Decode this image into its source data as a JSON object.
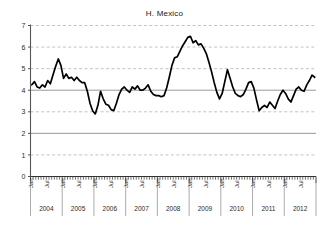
{
  "chart_data": {
    "type": "line",
    "title": "H. Mexico",
    "xlabel": "",
    "ylabel": "",
    "ylim": [
      0,
      7
    ],
    "yticks": [
      0,
      1,
      2,
      3,
      4,
      5,
      6,
      7
    ],
    "ytick_labels": [
      "0",
      "1",
      "2",
      "3",
      "4",
      "5",
      "6",
      "7"
    ],
    "solid_gridlines": [
      2,
      4
    ],
    "dashed_gridlines": [
      1,
      3,
      5,
      6,
      7
    ],
    "grid": true,
    "legend": null,
    "legend_position": "none",
    "line_color": "#000000",
    "x_start_label": "Jan 2004",
    "x_end_label": "Dec 2012",
    "month_tick_labels": [
      "Jan",
      "Jul"
    ],
    "years": [
      "2004",
      "2005",
      "2006",
      "2007",
      "2008",
      "2009",
      "2010",
      "2011",
      "2012"
    ],
    "x": [
      "2004-01",
      "2004-02",
      "2004-03",
      "2004-04",
      "2004-05",
      "2004-06",
      "2004-07",
      "2004-08",
      "2004-09",
      "2004-10",
      "2004-11",
      "2004-12",
      "2005-01",
      "2005-02",
      "2005-03",
      "2005-04",
      "2005-05",
      "2005-06",
      "2005-07",
      "2005-08",
      "2005-09",
      "2005-10",
      "2005-11",
      "2005-12",
      "2006-01",
      "2006-02",
      "2006-03",
      "2006-04",
      "2006-05",
      "2006-06",
      "2006-07",
      "2006-08",
      "2006-09",
      "2006-10",
      "2006-11",
      "2006-12",
      "2007-01",
      "2007-02",
      "2007-03",
      "2007-04",
      "2007-05",
      "2007-06",
      "2007-07",
      "2007-08",
      "2007-09",
      "2007-10",
      "2007-11",
      "2007-12",
      "2008-01",
      "2008-02",
      "2008-03",
      "2008-04",
      "2008-05",
      "2008-06",
      "2008-07",
      "2008-08",
      "2008-09",
      "2008-10",
      "2008-11",
      "2008-12",
      "2009-01",
      "2009-02",
      "2009-03",
      "2009-04",
      "2009-05",
      "2009-06",
      "2009-07",
      "2009-08",
      "2009-09",
      "2009-10",
      "2009-11",
      "2009-12",
      "2010-01",
      "2010-02",
      "2010-03",
      "2010-04",
      "2010-05",
      "2010-06",
      "2010-07",
      "2010-08",
      "2010-09",
      "2010-10",
      "2010-11",
      "2010-12",
      "2011-01",
      "2011-02",
      "2011-03",
      "2011-04",
      "2011-05",
      "2011-06",
      "2011-07",
      "2011-08",
      "2011-09",
      "2011-10",
      "2011-11",
      "2011-12",
      "2012-01",
      "2012-02",
      "2012-03",
      "2012-04",
      "2012-05",
      "2012-06",
      "2012-07",
      "2012-08",
      "2012-09",
      "2012-10",
      "2012-11",
      "2012-12"
    ],
    "values": [
      4.25,
      4.4,
      4.15,
      4.1,
      4.25,
      4.15,
      4.45,
      4.3,
      4.7,
      5.1,
      5.45,
      5.15,
      4.55,
      4.75,
      4.55,
      4.6,
      4.45,
      4.6,
      4.45,
      4.35,
      4.35,
      3.95,
      3.4,
      3.05,
      2.9,
      3.3,
      3.95,
      3.6,
      3.35,
      3.3,
      3.1,
      3.05,
      3.4,
      3.8,
      4.05,
      4.15,
      4.0,
      3.9,
      4.15,
      4.05,
      4.2,
      4.0,
      4.0,
      4.1,
      4.25,
      3.95,
      3.8,
      3.75,
      3.75,
      3.7,
      3.75,
      4.1,
      4.6,
      5.15,
      5.5,
      5.55,
      5.8,
      6.05,
      6.25,
      6.45,
      6.5,
      6.2,
      6.3,
      6.1,
      6.15,
      5.95,
      5.7,
      5.3,
      4.85,
      4.35,
      3.9,
      3.6,
      3.85,
      4.4,
      4.95,
      4.55,
      4.15,
      3.85,
      3.75,
      3.7,
      3.8,
      4.05,
      4.35,
      4.4,
      4.1,
      3.55,
      3.05,
      3.2,
      3.3,
      3.2,
      3.45,
      3.3,
      3.15,
      3.5,
      3.8,
      4.0,
      3.85,
      3.6,
      3.45,
      3.75,
      4.05,
      4.15,
      4.0,
      3.95,
      4.25,
      4.45,
      4.7,
      4.6
    ]
  }
}
